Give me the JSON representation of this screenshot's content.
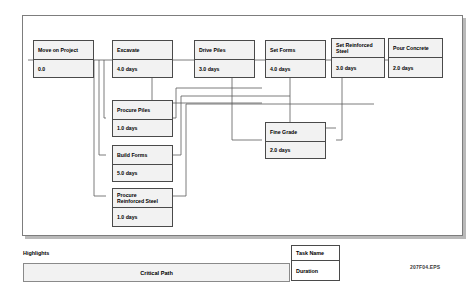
{
  "diagram": {
    "file_code": "207F04.EPS",
    "nodes": [
      {
        "id": "move-on-project",
        "name": "Move on Project",
        "duration": "0.0"
      },
      {
        "id": "excavate",
        "name": "Excavate",
        "duration": "4.0 days"
      },
      {
        "id": "drive-piles",
        "name": "Drive Piles",
        "duration": "3.0 days"
      },
      {
        "id": "set-forms",
        "name": "Set Forms",
        "duration": "4.0 days"
      },
      {
        "id": "set-reinforced-steel",
        "name": "Set Reinforced\nSteel",
        "duration": "3.0 days"
      },
      {
        "id": "pour-concrete",
        "name": "Pour Concrete",
        "duration": "2.0 days"
      },
      {
        "id": "procure-piles",
        "name": "Procure Piles",
        "duration": "1.0 days"
      },
      {
        "id": "build-forms",
        "name": "Build Forms",
        "duration": "5.0 days"
      },
      {
        "id": "procure-reinforced-steel",
        "name": "Procure\nReinforced Steel",
        "duration": "1.0 days"
      },
      {
        "id": "fine-grade",
        "name": "Fine Grade",
        "duration": "2.0 days"
      }
    ]
  },
  "legend": {
    "highlights_label": "Highlights",
    "critical_path_label": "Critical Path",
    "key_task_name": "Task Name",
    "key_duration": "Duration"
  },
  "colors": {
    "node_fill": "#f2f2f2",
    "node_border": "#4a4a4a",
    "frame_border": "#7d7d7d",
    "shadow": "#b9b9b9",
    "link": "#5a5a5a"
  }
}
